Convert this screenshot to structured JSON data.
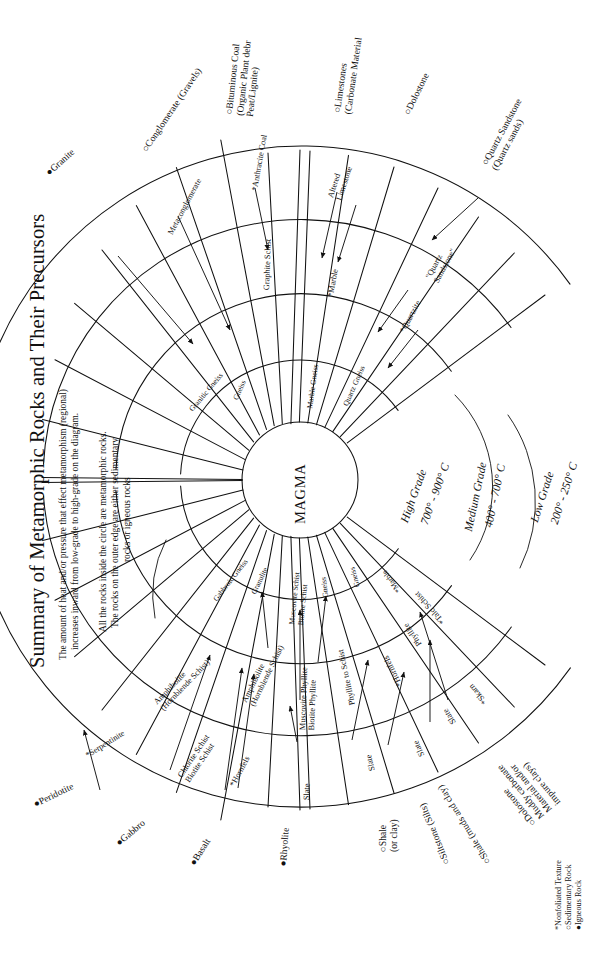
{
  "title": "Summary of Metamorphic Rocks and Their Precursors",
  "description": [
    "The amount of heat and/or pressure that effect metamorphism (regional)",
    "increases inward from low-grade to high-grade on the diagram.",
    "All the rocks inside the circle are metamorphic rocks.",
    "The rocks on the outer edge are either sedimentary",
    "rocks or igneous rocks"
  ],
  "center_label": "MAGMA",
  "grades": [
    {
      "name": "High Grade",
      "temp": "700° - 900° C"
    },
    {
      "name": "Medium Grade",
      "temp": "400° - 700° C"
    },
    {
      "name": "Low Grade",
      "temp": "200° - 250° C"
    }
  ],
  "legend": [
    "*Nonfoliated Texture",
    "○Sedimentary Rock",
    "●Igneous Rock"
  ],
  "sectors": {
    "s01": {
      "outer": "●Granite",
      "low": "",
      "med": "",
      "high": ""
    },
    "s02": {
      "outer": "○Conglomerate (Gravels)",
      "low": "Metaconglomerate",
      "med": "",
      "high": "Granitic Gneiss"
    },
    "s03": {
      "outer": "○Bituminous Coal\n(Organic Plant debr\nPeat/Lignite)",
      "low": "*Anthracite Coal",
      "med": "Graphite Schist",
      "high": "Gneiss"
    },
    "s04": {
      "outer": "○Limestones\n(Carbonate Material",
      "low": "Altered\nLimestone",
      "med": "*Marble",
      "high": "Marble Gneiss"
    },
    "s05": {
      "outer": "○Dolostone",
      "low": "",
      "med": "",
      "high": "Quartz Gneiss"
    },
    "s06": {
      "outer": "○Quartz Sandstone\n(Quartz sands)",
      "low": "\"Quartz\nSandstone\"",
      "med": "*Quartzite",
      "high": ""
    },
    "s07": {
      "outer": "●Peridotite",
      "low": "",
      "med": "*Serpentinite",
      "high": ""
    },
    "s08": {
      "outer": "●Gabbro",
      "low": "",
      "med": "Amphibolite\n(Hornblende Schist)",
      "high": "Gabbroic Gneiss"
    },
    "s09": {
      "outer": "●Basalt",
      "low": "Chlorite Schist\nBiotite Schist",
      "med": "Amphibolite\n(Hornblende Schist)",
      "high": "Granulite"
    },
    "s10": {
      "outer": "",
      "low": "*Hornfels",
      "med": "",
      "high": ""
    },
    "s11": {
      "outer": "●Rhyolite",
      "low": "Slate",
      "med": "Muscovite Phyllite\nBiotite Phyllite",
      "high": "Muscovite Schist\nBiotite Schist"
    },
    "s12": {
      "outer": "○Shale\n(or clay)",
      "low": "Slate",
      "med": "Phyllite to Schist",
      "high": "Gneiss"
    },
    "s13": {
      "outer": "○Siltstone (Silts)",
      "low": "Slate",
      "med": "*Hornfels",
      "high": "Gneiss"
    },
    "s14": {
      "outer": "○Shale (muds and clay)",
      "low": "Slate",
      "med": "Phyllite",
      "high": ""
    },
    "s15": {
      "outer": "○Dolostone\nMuddy carbonate\nMaterial and/or\nimpure clays)",
      "low": "*Skarn",
      "med": "*Talc Schist",
      "high": "*Marble"
    }
  }
}
